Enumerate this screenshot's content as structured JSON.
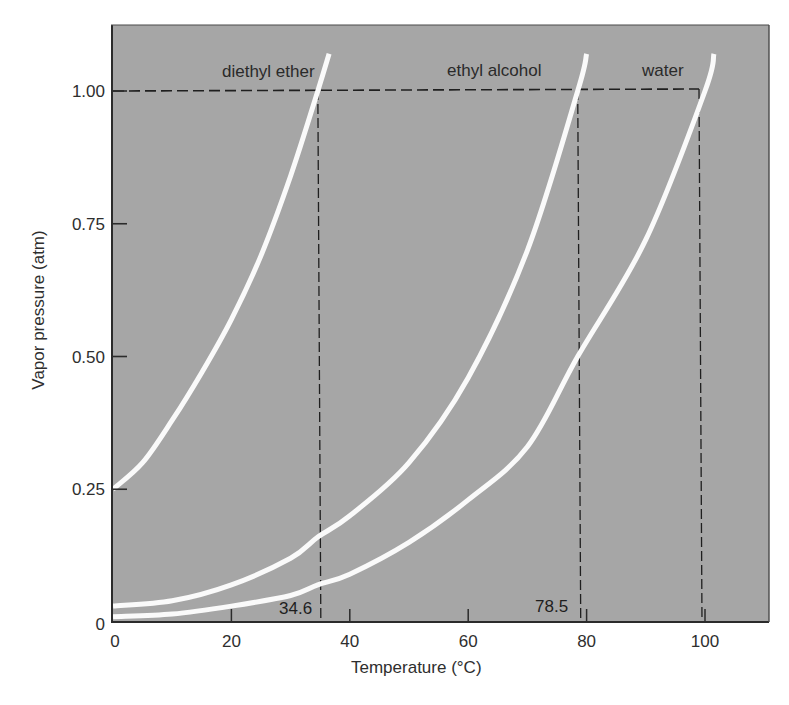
{
  "chart_data": {
    "type": "line",
    "title": "",
    "xlabel": "Temperature (°C)",
    "ylabel": "Vapor pressure (atm)",
    "xlim": [
      0,
      110
    ],
    "ylim": [
      0,
      1.1
    ],
    "xticks": [
      0,
      20,
      40,
      60,
      80,
      100
    ],
    "xtick_labels": [
      "0",
      "20",
      "40",
      "60",
      "80",
      "100"
    ],
    "yticks": [
      0,
      0.25,
      0.5,
      0.75,
      1.0
    ],
    "ytick_labels": [
      "0",
      "0.25",
      "0.50",
      "0.75",
      "1.00"
    ],
    "grid": false,
    "legend": "inline labels at top of each curve",
    "series": [
      {
        "name": "diethyl ether",
        "x": [
          0,
          5,
          10,
          15,
          20,
          25,
          30,
          34.6,
          36.5
        ],
        "y": [
          0.25,
          0.3,
          0.38,
          0.47,
          0.57,
          0.69,
          0.84,
          1.0,
          1.07
        ]
      },
      {
        "name": "ethyl alcohol",
        "x": [
          0,
          10,
          20,
          30,
          34.6,
          40,
          50,
          60,
          70,
          78.5,
          80
        ],
        "y": [
          0.03,
          0.04,
          0.07,
          0.12,
          0.16,
          0.2,
          0.3,
          0.46,
          0.7,
          1.0,
          1.07
        ]
      },
      {
        "name": "water",
        "x": [
          0,
          10,
          20,
          30,
          34.6,
          40,
          50,
          60,
          70,
          78.5,
          90,
          100,
          101.5
        ],
        "y": [
          0.01,
          0.015,
          0.03,
          0.05,
          0.07,
          0.09,
          0.15,
          0.23,
          0.33,
          0.5,
          0.72,
          1.0,
          1.07
        ]
      }
    ],
    "reference_lines": {
      "horizontal": {
        "y": 1.0,
        "style": "dashed",
        "x_from": 0,
        "x_to": 100
      },
      "vertical": [
        {
          "x": 34.6,
          "label": "34.6",
          "style": "dashed"
        },
        {
          "x": 78.5,
          "label": "78.5",
          "style": "dashed"
        },
        {
          "x": 100,
          "label": "",
          "style": "dashed"
        }
      ]
    },
    "annotations": [
      "diethyl ether",
      "ethyl alcohol",
      "water",
      "34.6",
      "78.5"
    ]
  },
  "colors": {
    "plot_background": "#a6a6a6",
    "curve": "#fafafa",
    "axis": "#2b2b2b",
    "reference_line": "#1f1f1f",
    "page_background": "#ffffff"
  },
  "labels": {
    "ether": "diethyl ether",
    "alcohol": "ethyl alcohol",
    "water": "water",
    "bp_ether": "34.6",
    "bp_alcohol": "78.5"
  }
}
